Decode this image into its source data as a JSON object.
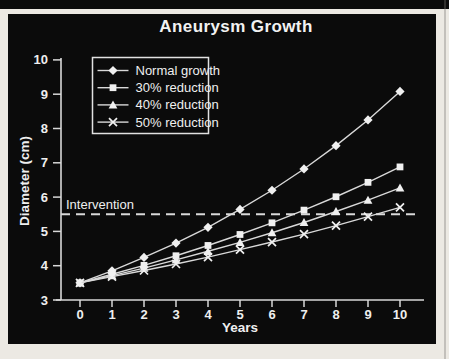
{
  "chart_data": {
    "type": "line",
    "title": "Aneurysm Growth",
    "xlabel": "Years",
    "ylabel": "Diameter (cm)",
    "x": [
      0,
      1,
      2,
      3,
      4,
      5,
      6,
      7,
      8,
      9,
      10
    ],
    "xticks": [
      0,
      1,
      2,
      3,
      4,
      5,
      6,
      7,
      8,
      9,
      10
    ],
    "yticks": [
      3,
      4,
      5,
      6,
      7,
      8,
      9,
      10
    ],
    "xlim": [
      0,
      10
    ],
    "ylim": [
      3,
      10
    ],
    "grid": false,
    "legend_position": "upper-left",
    "series": [
      {
        "name": "Normal growth",
        "marker": "diamond",
        "values": [
          3.5,
          3.85,
          4.24,
          4.66,
          5.12,
          5.64,
          6.2,
          6.82,
          7.5,
          8.25,
          9.08
        ]
      },
      {
        "name": "30% reduction",
        "marker": "square",
        "values": [
          3.5,
          3.75,
          4.01,
          4.29,
          4.59,
          4.91,
          5.25,
          5.62,
          6.01,
          6.43,
          6.88
        ]
      },
      {
        "name": "40% reduction",
        "marker": "triangle",
        "values": [
          3.5,
          3.71,
          3.93,
          4.17,
          4.42,
          4.68,
          4.96,
          5.26,
          5.58,
          5.91,
          6.27
        ]
      },
      {
        "name": "50% reduction",
        "marker": "x",
        "values": [
          3.5,
          3.68,
          3.86,
          4.05,
          4.25,
          4.47,
          4.69,
          4.92,
          5.17,
          5.43,
          5.7
        ]
      }
    ],
    "annotations": [
      {
        "text": "Intervention",
        "y": 5.5,
        "style": "dashed-horizontal-line"
      }
    ],
    "colors": {
      "panel_background": "#0b0b0b",
      "page_background": "#ece9e3",
      "line": "#d9d9d9",
      "marker": "#f0f0f0",
      "text": "#efefef",
      "axis": "#d9d9d9"
    }
  }
}
